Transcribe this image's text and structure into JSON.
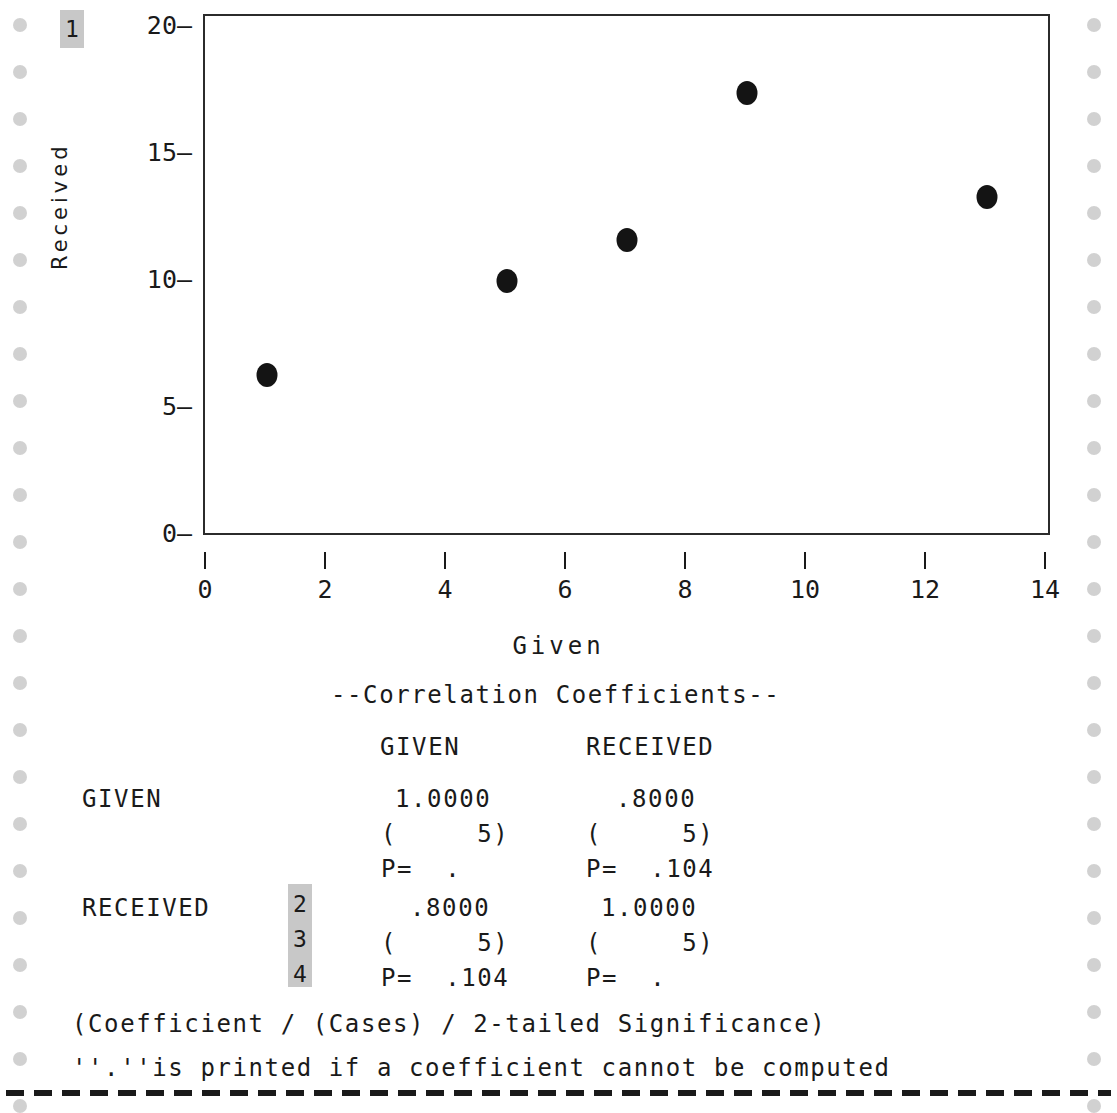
{
  "chart_data": {
    "type": "scatter",
    "title": "",
    "xlabel": "Given",
    "ylabel": "Received",
    "xlim": [
      0,
      14
    ],
    "ylim": [
      0,
      20
    ],
    "xticks": [
      0,
      2,
      4,
      6,
      8,
      10,
      12,
      14
    ],
    "yticks": [
      0,
      5,
      10,
      15,
      20
    ],
    "grid": false,
    "legend": "none",
    "marker": "filled-circle",
    "marker_color": "#141414",
    "points": [
      {
        "x": 1,
        "y": 6.3
      },
      {
        "x": 5,
        "y": 10.0
      },
      {
        "x": 7,
        "y": 11.6
      },
      {
        "x": 9,
        "y": 17.4
      },
      {
        "x": 13,
        "y": 13.3
      }
    ]
  },
  "markers": {
    "one": "1",
    "two": "2",
    "three": "3",
    "four": "4"
  },
  "report": {
    "heading": "--Correlation Coefficients--",
    "col_headers": [
      "GIVEN",
      "RECEIVED"
    ],
    "rows": [
      {
        "label": "GIVEN",
        "coefficients": [
          "1.0000",
          ".8000"
        ],
        "cases": [
          "(     5)",
          "(     5)"
        ],
        "significance": [
          "P=  .",
          "P=  .104"
        ]
      },
      {
        "label": "RECEIVED",
        "coefficients": [
          ".8000",
          "1.0000"
        ],
        "cases": [
          "(     5)",
          "(     5)"
        ],
        "significance": [
          "P=  .104",
          "P=  ."
        ]
      }
    ],
    "footnote_legend": "(Coefficient / (Cases) / 2-tailed Significance)",
    "footnote_dot": "''.''is printed if a coefficient cannot be computed"
  },
  "colors": {
    "ink": "#1a1a1a",
    "marker_highlight": "#c8c8c8",
    "feed_hole": "#c9c9c9"
  }
}
